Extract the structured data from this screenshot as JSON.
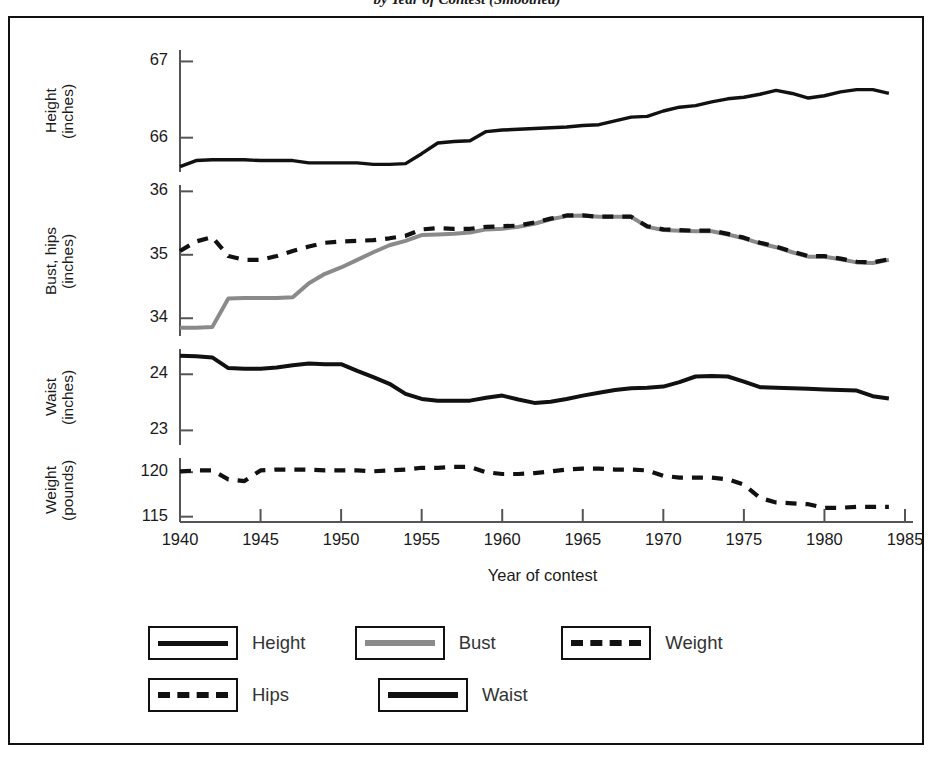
{
  "title": "by Year of Contest (Smoothed)",
  "axes": {
    "x_title": "Year of contest",
    "x_ticks": [
      "1940",
      "1945",
      "1950",
      "1955",
      "1960",
      "1965",
      "1970",
      "1975",
      "1980",
      "1985"
    ],
    "panels": [
      {
        "name": "height",
        "label_line1": "Height",
        "label_line2": "(inches)",
        "ticks": [
          "67",
          "66"
        ]
      },
      {
        "name": "bust-hips",
        "label_line1": "Bust, hips",
        "label_line2": "(inches)",
        "ticks": [
          "36",
          "35",
          "34"
        ]
      },
      {
        "name": "waist",
        "label_line1": "Waist",
        "label_line2": "(inches)",
        "ticks": [
          "24",
          "23"
        ]
      },
      {
        "name": "weight",
        "label_line1": "Weight",
        "label_line2": "(pounds)",
        "ticks": [
          "120",
          "115"
        ]
      }
    ]
  },
  "legend": {
    "rows": [
      [
        {
          "label": "Height",
          "style": "solid",
          "color": "#111"
        },
        {
          "label": "Bust",
          "style": "solid",
          "color": "#8a8a8a"
        },
        {
          "label": "Weight",
          "style": "dashed",
          "color": "#111"
        }
      ],
      [
        {
          "label": "Hips",
          "style": "dashed",
          "color": "#111"
        },
        {
          "label": "Waist",
          "style": "solid-thick",
          "color": "#111"
        }
      ]
    ]
  },
  "colors": {
    "height": "#111111",
    "bust": "#8a8a8a",
    "hips": "#111111",
    "waist": "#111111",
    "weight": "#111111",
    "axis": "#555555",
    "frame": "#111111"
  },
  "chart_data": {
    "type": "line",
    "title": "by Year of Contest (Smoothed)",
    "xlabel": "Year of contest",
    "grid": false,
    "legend_position": "bottom",
    "x": [
      1940,
      1941,
      1942,
      1943,
      1944,
      1945,
      1946,
      1947,
      1948,
      1949,
      1950,
      1951,
      1952,
      1953,
      1954,
      1955,
      1956,
      1957,
      1958,
      1959,
      1960,
      1961,
      1962,
      1963,
      1964,
      1965,
      1966,
      1967,
      1968,
      1969,
      1970,
      1971,
      1972,
      1973,
      1974,
      1975,
      1976,
      1977,
      1978,
      1979,
      1980,
      1981,
      1982,
      1983,
      1984
    ],
    "panels": [
      {
        "name": "Height",
        "ylabel": "Height (inches)",
        "unit": "inches",
        "ylim": [
          65.55,
          67.15
        ],
        "yticks": [
          66,
          67
        ],
        "series": [
          {
            "name": "Height",
            "style": "solid",
            "color": "#111111",
            "values": [
              65.62,
              65.7,
              65.71,
              65.71,
              65.71,
              65.7,
              65.7,
              65.7,
              65.67,
              65.67,
              65.67,
              65.67,
              65.65,
              65.65,
              65.66,
              65.79,
              65.93,
              65.95,
              65.96,
              66.08,
              66.1,
              66.11,
              66.12,
              66.13,
              66.14,
              66.16,
              66.17,
              66.22,
              66.27,
              66.28,
              66.35,
              66.4,
              66.42,
              66.47,
              66.51,
              66.53,
              66.57,
              66.62,
              66.58,
              66.52,
              66.55,
              66.6,
              66.63,
              66.63,
              66.58
            ]
          }
        ]
      },
      {
        "name": "Bust, hips",
        "ylabel": "Bust, hips (inches)",
        "unit": "inches",
        "ylim": [
          33.72,
          36.1
        ],
        "yticks": [
          34,
          35,
          36
        ],
        "series": [
          {
            "name": "Bust",
            "style": "solid",
            "color": "#8a8a8a",
            "values": [
              33.85,
              33.85,
              33.86,
              34.31,
              34.32,
              34.32,
              34.32,
              34.33,
              34.55,
              34.7,
              34.8,
              34.92,
              35.04,
              35.15,
              35.22,
              35.31,
              35.32,
              35.33,
              35.35,
              35.4,
              35.41,
              35.44,
              35.49,
              35.56,
              35.61,
              35.62,
              35.6,
              35.6,
              35.6,
              35.44,
              35.39,
              35.38,
              35.37,
              35.37,
              35.32,
              35.26,
              35.18,
              35.12,
              35.04,
              34.97,
              34.97,
              34.93,
              34.88,
              34.87,
              34.92
            ]
          },
          {
            "name": "Hips",
            "style": "dashed",
            "color": "#111111",
            "values": [
              35.06,
              35.21,
              35.28,
              34.98,
              34.92,
              34.92,
              34.98,
              35.06,
              35.13,
              35.19,
              35.21,
              35.22,
              35.23,
              35.26,
              35.3,
              35.4,
              35.42,
              35.41,
              35.41,
              35.44,
              35.45,
              35.46,
              35.51,
              35.57,
              35.62,
              35.62,
              35.6,
              35.6,
              35.6,
              35.45,
              35.4,
              35.39,
              35.38,
              35.38,
              35.33,
              35.27,
              35.19,
              35.13,
              35.05,
              34.98,
              34.98,
              34.94,
              34.89,
              34.88,
              34.93
            ]
          }
        ]
      },
      {
        "name": "Waist",
        "ylabel": "Waist (inches)",
        "unit": "inches",
        "ylim": [
          22.74,
          24.45
        ],
        "yticks": [
          23,
          24
        ],
        "series": [
          {
            "name": "Waist",
            "style": "solid-thick",
            "color": "#111111",
            "values": [
              24.33,
              24.32,
              24.3,
              24.11,
              24.1,
              24.1,
              24.12,
              24.16,
              24.19,
              24.18,
              24.18,
              24.06,
              23.95,
              23.83,
              23.65,
              23.56,
              23.53,
              23.53,
              23.53,
              23.58,
              23.62,
              23.55,
              23.49,
              23.51,
              23.56,
              23.62,
              23.67,
              23.72,
              23.75,
              23.76,
              23.78,
              23.86,
              23.96,
              23.97,
              23.96,
              23.87,
              23.77,
              23.76,
              23.75,
              23.74,
              23.73,
              23.72,
              23.71,
              23.61,
              23.57
            ]
          }
        ]
      },
      {
        "name": "Weight",
        "ylabel": "Weight (pounds)",
        "unit": "pounds",
        "ylim": [
          114.4,
          121.6
        ],
        "yticks": [
          115,
          120
        ],
        "series": [
          {
            "name": "Weight",
            "style": "dashed",
            "color": "#111111",
            "values": [
              120.1,
              120.2,
              120.2,
              119.2,
              119.0,
              120.2,
              120.3,
              120.3,
              120.3,
              120.2,
              120.2,
              120.2,
              120.1,
              120.2,
              120.3,
              120.5,
              120.5,
              120.6,
              120.6,
              120.0,
              119.8,
              119.8,
              119.9,
              120.1,
              120.3,
              120.4,
              120.4,
              120.3,
              120.3,
              120.2,
              119.6,
              119.4,
              119.4,
              119.4,
              119.2,
              118.6,
              117.1,
              116.6,
              116.5,
              116.4,
              116.0,
              116.0,
              116.1,
              116.1,
              116.1
            ]
          }
        ]
      }
    ]
  }
}
